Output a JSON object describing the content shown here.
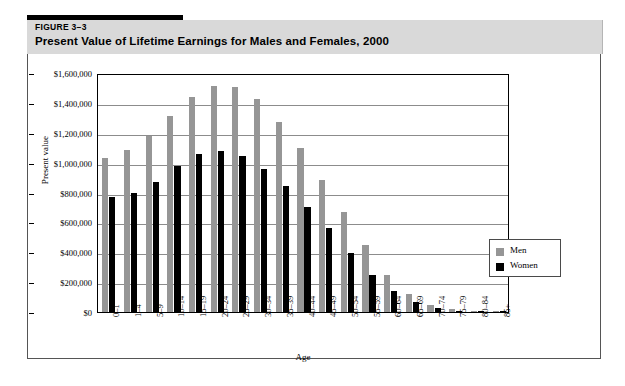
{
  "header": {
    "figure_number": "FIGURE 3–3",
    "title": "Present Value of Lifetime Earnings for Males and Females, 2000"
  },
  "legend": {
    "position": "inside-right",
    "entries": [
      {
        "label": "Men",
        "color": "#969696"
      },
      {
        "label": "Women",
        "color": "#000000"
      }
    ]
  },
  "colors": {
    "men": "#969696",
    "women": "#000000",
    "header_band": "#d9d9d9",
    "gridline": "#8c8c8c",
    "axis": "#000000"
  },
  "chart_data": {
    "type": "bar",
    "title": "Present Value of Lifetime Earnings for Males and Females, 2000",
    "xlabel": "Age",
    "ylabel": "Present value",
    "ylim": [
      0,
      1600000
    ],
    "ytick_step": 200000,
    "ytick_labels": [
      "$1,600,000",
      "$1,400,000",
      "$1,200,000",
      "$1,000,000",
      "$800,000",
      "$600,000",
      "$400,000",
      "$200,000",
      "$0"
    ],
    "ytick_values": [
      1600000,
      1400000,
      1200000,
      1000000,
      800000,
      600000,
      400000,
      200000,
      0
    ],
    "grid": true,
    "categories": [
      "0–1",
      "1–4",
      "5–9",
      "10–14",
      "15–19",
      "20–24",
      "25–29",
      "30–34",
      "35–39",
      "40–44",
      "45–49",
      "50–54",
      "55–59",
      "60–64",
      "65–69",
      "70–74",
      "75–79",
      "80–84",
      "85+"
    ],
    "series": [
      {
        "name": "Men",
        "color": "#969696",
        "values": [
          1030000,
          1085000,
          1180000,
          1310000,
          1440000,
          1510000,
          1505000,
          1425000,
          1270000,
          1095000,
          885000,
          670000,
          450000,
          250000,
          120000,
          45000,
          20000,
          10000,
          5000
        ]
      },
      {
        "name": "Women",
        "color": "#000000",
        "values": [
          770000,
          800000,
          870000,
          975000,
          1055000,
          1080000,
          1045000,
          955000,
          845000,
          700000,
          560000,
          395000,
          245000,
          140000,
          65000,
          25000,
          10000,
          5000,
          3000
        ]
      }
    ]
  }
}
